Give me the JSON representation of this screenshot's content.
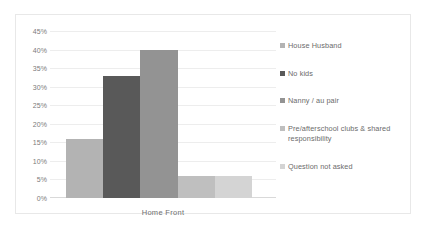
{
  "chart_data": {
    "type": "bar",
    "title": "",
    "subtitle": "",
    "xlabel": "",
    "ylabel": "",
    "categories": [
      "Home Front"
    ],
    "series": [
      {
        "name": "House Husband",
        "values": [
          16
        ],
        "color": "#b3b3b3"
      },
      {
        "name": "No kids",
        "values": [
          33
        ],
        "color": "#595959"
      },
      {
        "name": "Nanny / au pair",
        "values": [
          40
        ],
        "color": "#939393"
      },
      {
        "name": "Pre/afterschool clubs & shared responsibility",
        "values": [
          6
        ],
        "color": "#bfbfbf"
      },
      {
        "name": "Question not asked",
        "values": [
          6
        ],
        "color": "#d4d4d4"
      }
    ],
    "ylim": [
      0,
      45
    ],
    "ytick_step": 5,
    "ytick_labels": [
      "0%",
      "5%",
      "10%",
      "15%",
      "20%",
      "25%",
      "30%",
      "35%",
      "40%",
      "45%"
    ],
    "ytick_values": [
      0,
      5,
      10,
      15,
      20,
      25,
      30,
      35,
      40,
      45
    ],
    "grid": true,
    "grid_axis": "y",
    "legend": true,
    "legend_position": "right",
    "value_format": "percent",
    "colors": {
      "gridline": "#ededed",
      "axis": "#d9d9d9",
      "border": "#e8e8e8",
      "background": "#ffffff",
      "tick_text": "#7b7b7b",
      "legend_text": "#6b6b6b"
    }
  }
}
